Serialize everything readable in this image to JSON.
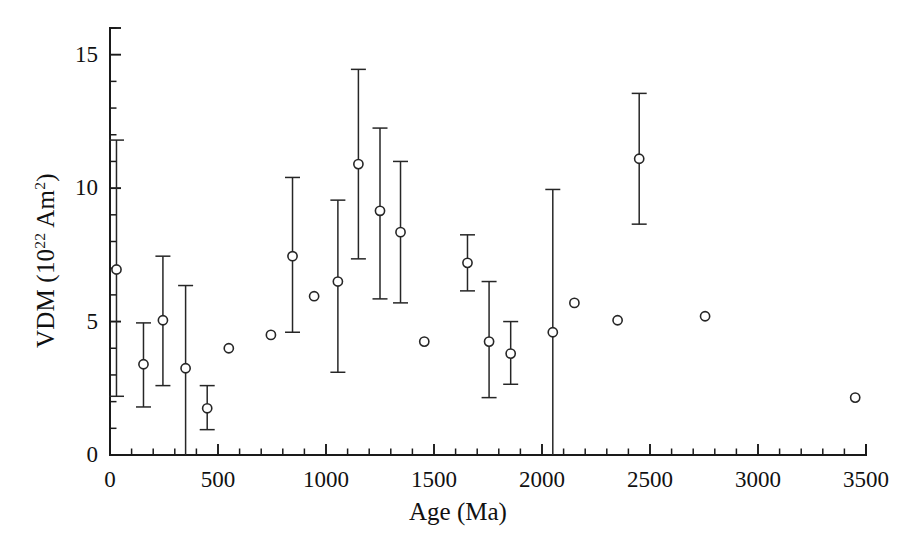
{
  "chart_data": {
    "type": "scatter",
    "title": "",
    "xlabel": "Age (Ma)",
    "ylabel": "VDM (10^22 Am^2)",
    "ylabel_parts": {
      "prefix": "VDM (10",
      "exp1": "22",
      "mid": " Am",
      "exp2": "2",
      "suffix": ")"
    },
    "xlim": [
      0,
      3500
    ],
    "ylim": [
      0,
      16
    ],
    "grid": false,
    "legend": null,
    "x_major_ticks": [
      0,
      500,
      1000,
      1500,
      2000,
      2500,
      3000,
      3500
    ],
    "x_tick_labels": [
      "0",
      "500",
      "1000",
      "1500",
      "2000",
      "2500",
      "3000",
      "3500"
    ],
    "x_minor_step": 100,
    "y_major_ticks": [
      0,
      5,
      10,
      15
    ],
    "y_tick_labels": [
      "0",
      "5",
      "10",
      "15"
    ],
    "y_minor_step": 1,
    "marker": "open-circle",
    "errorbar_style": "capped-vertical",
    "series": [
      {
        "name": "VDM",
        "points": [
          {
            "x": 30,
            "y": 6.95,
            "ylow": 2.2,
            "yhigh": 11.8,
            "capped_low": true,
            "capped_high": true
          },
          {
            "x": 155,
            "y": 3.4,
            "ylow": 1.8,
            "yhigh": 4.95,
            "capped_low": true,
            "capped_high": true
          },
          {
            "x": 245,
            "y": 5.05,
            "ylow": 2.6,
            "yhigh": 7.45,
            "capped_low": true,
            "capped_high": true
          },
          {
            "x": 350,
            "y": 3.25,
            "ylow": 0.0,
            "yhigh": 6.35,
            "capped_low": false,
            "capped_high": true
          },
          {
            "x": 450,
            "y": 1.75,
            "ylow": 0.95,
            "yhigh": 2.6,
            "capped_low": true,
            "capped_high": true
          },
          {
            "x": 550,
            "y": 4.0,
            "ylow": null,
            "yhigh": null,
            "capped_low": false,
            "capped_high": false
          },
          {
            "x": 745,
            "y": 4.5,
            "ylow": null,
            "yhigh": null,
            "capped_low": false,
            "capped_high": false
          },
          {
            "x": 845,
            "y": 7.45,
            "ylow": 4.6,
            "yhigh": 10.4,
            "capped_low": true,
            "capped_high": true
          },
          {
            "x": 945,
            "y": 5.95,
            "ylow": null,
            "yhigh": null,
            "capped_low": false,
            "capped_high": false
          },
          {
            "x": 1055,
            "y": 6.5,
            "ylow": 3.1,
            "yhigh": 9.55,
            "capped_low": true,
            "capped_high": true
          },
          {
            "x": 1150,
            "y": 10.9,
            "ylow": 7.35,
            "yhigh": 14.45,
            "capped_low": true,
            "capped_high": true
          },
          {
            "x": 1250,
            "y": 9.15,
            "ylow": 5.85,
            "yhigh": 12.25,
            "capped_low": true,
            "capped_high": true
          },
          {
            "x": 1345,
            "y": 8.35,
            "ylow": 5.7,
            "yhigh": 11.0,
            "capped_low": true,
            "capped_high": true
          },
          {
            "x": 1455,
            "y": 4.25,
            "ylow": null,
            "yhigh": null,
            "capped_low": false,
            "capped_high": false
          },
          {
            "x": 1655,
            "y": 7.2,
            "ylow": 6.15,
            "yhigh": 8.25,
            "capped_low": true,
            "capped_high": true
          },
          {
            "x": 1755,
            "y": 4.25,
            "ylow": 2.15,
            "yhigh": 6.5,
            "capped_low": true,
            "capped_high": true
          },
          {
            "x": 1855,
            "y": 3.8,
            "ylow": 2.65,
            "yhigh": 5.0,
            "capped_low": true,
            "capped_high": true
          },
          {
            "x": 2050,
            "y": 4.6,
            "ylow": 0.0,
            "yhigh": 9.95,
            "capped_low": false,
            "capped_high": true
          },
          {
            "x": 2150,
            "y": 5.7,
            "ylow": null,
            "yhigh": null,
            "capped_low": false,
            "capped_high": false
          },
          {
            "x": 2350,
            "y": 5.05,
            "ylow": null,
            "yhigh": null,
            "capped_low": false,
            "capped_high": false
          },
          {
            "x": 2450,
            "y": 11.1,
            "ylow": 8.65,
            "yhigh": 13.55,
            "capped_low": true,
            "capped_high": true
          },
          {
            "x": 2755,
            "y": 5.2,
            "ylow": null,
            "yhigh": null,
            "capped_low": false,
            "capped_high": false
          },
          {
            "x": 3450,
            "y": 2.15,
            "ylow": null,
            "yhigh": null,
            "capped_low": false,
            "capped_high": false
          }
        ]
      }
    ],
    "colors": {
      "marker_stroke": "#262626",
      "errorbar": "#262626",
      "axis": "#1a1a1a",
      "background": "#ffffff"
    }
  }
}
